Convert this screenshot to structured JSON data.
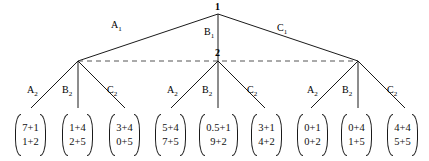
{
  "figure": {
    "type": "tree-diagram",
    "background": "#ffffff",
    "line_color": "#1a1a1a",
    "dashed_line_color": "#555555"
  },
  "nodes": {
    "root": {
      "label": "1",
      "x": 218,
      "y": 14
    },
    "level2": [
      {
        "label": "",
        "x": 78,
        "y": 61
      },
      {
        "label": "2",
        "x": 218,
        "y": 61
      },
      {
        "label": "",
        "x": 358,
        "y": 61
      }
    ]
  },
  "edges_level1": [
    {
      "name": "A1",
      "base": "A",
      "sub": "1",
      "label_x": 111,
      "label_y": 24
    },
    {
      "name": "B1",
      "base": "B",
      "sub": "1",
      "label_x": 204,
      "label_y": 30
    },
    {
      "name": "C1",
      "base": "C",
      "sub": "1",
      "label_x": 277,
      "label_y": 27
    }
  ],
  "edges_level2": [
    {
      "name": "A2",
      "base": "A",
      "sub": "2",
      "label_x": 31,
      "label_y": 89
    },
    {
      "name": "B2",
      "base": "B",
      "sub": "2",
      "label_x": 64,
      "label_y": 89
    },
    {
      "name": "C2",
      "base": "C",
      "sub": "2",
      "label_x": 109,
      "label_y": 89
    },
    {
      "name": "A2",
      "base": "A",
      "sub": "2",
      "label_x": 171,
      "label_y": 89
    },
    {
      "name": "B2",
      "base": "B",
      "sub": "2",
      "label_x": 204,
      "label_y": 89
    },
    {
      "name": "C2",
      "base": "C",
      "sub": "2",
      "label_x": 249,
      "label_y": 89
    },
    {
      "name": "A2",
      "base": "A",
      "sub": "2",
      "label_x": 311,
      "label_y": 89
    },
    {
      "name": "B2",
      "base": "B",
      "sub": "2",
      "label_x": 344,
      "label_y": 89
    },
    {
      "name": "C2",
      "base": "C",
      "sub": "2",
      "label_x": 389,
      "label_y": 89
    }
  ],
  "matrices": [
    {
      "id": "m1",
      "x": 10,
      "y": 114,
      "w": 41,
      "h": 42,
      "rows": [
        "7+1",
        "1+2"
      ]
    },
    {
      "id": "m2",
      "x": 57,
      "y": 114,
      "w": 41,
      "h": 42,
      "rows": [
        "1+4",
        "2+5"
      ]
    },
    {
      "id": "m3",
      "x": 104,
      "y": 114,
      "w": 41,
      "h": 42,
      "rows": [
        "3+4",
        "0+5"
      ]
    },
    {
      "id": "m4",
      "x": 150,
      "y": 114,
      "w": 41,
      "h": 42,
      "rows": [
        "5+4",
        "7+5"
      ]
    },
    {
      "id": "m5",
      "x": 194,
      "y": 114,
      "w": 49,
      "h": 42,
      "rows": [
        "0.5+1",
        "9+2"
      ]
    },
    {
      "id": "m6",
      "x": 246,
      "y": 114,
      "w": 41,
      "h": 42,
      "rows": [
        "3+1",
        "4+2"
      ]
    },
    {
      "id": "m7",
      "x": 292,
      "y": 114,
      "w": 41,
      "h": 42,
      "rows": [
        "0+1",
        "0+2"
      ]
    },
    {
      "id": "m8",
      "x": 336,
      "y": 114,
      "w": 41,
      "h": 42,
      "rows": [
        "0+4",
        "1+5"
      ]
    },
    {
      "id": "m9",
      "x": 382,
      "y": 114,
      "w": 41,
      "h": 42,
      "rows": [
        "4+4",
        "5+5"
      ]
    }
  ]
}
